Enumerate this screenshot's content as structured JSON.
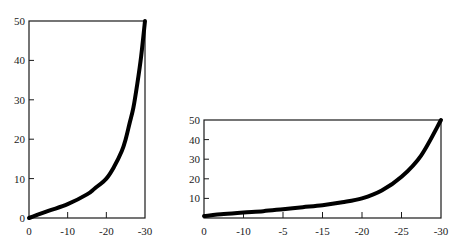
{
  "chart_data": [
    {
      "type": "line",
      "title": "",
      "xlabel": "",
      "ylabel": "",
      "grid": false,
      "legend": null,
      "xlim": [
        0,
        -30
      ],
      "ylim": [
        0,
        50
      ],
      "x_ticks": [
        "0",
        "-10",
        "-20",
        "-30"
      ],
      "y_ticks": [
        "0",
        "10",
        "20",
        "30",
        "40",
        "50"
      ],
      "series": [
        {
          "name": "curve",
          "x": [
            0,
            -5,
            -10,
            -15,
            -17,
            -20,
            -22,
            -24,
            -25,
            -26,
            -27,
            -28,
            -29,
            -30
          ],
          "y": [
            0,
            1.8,
            3.5,
            6,
            7.5,
            10,
            13,
            17,
            20,
            24,
            28,
            34,
            41,
            50
          ]
        }
      ],
      "frame": {
        "left": 29,
        "right": 145,
        "top": 21,
        "bottom": 218
      },
      "color": "#000000"
    },
    {
      "type": "line",
      "title": "",
      "xlabel": "",
      "ylabel": "",
      "grid": false,
      "legend": null,
      "ylim": [
        0,
        50
      ],
      "x_ticks": [
        "0",
        "-10",
        "-5",
        "-15",
        "-20",
        "-25",
        "-30"
      ],
      "y_ticks": [
        "10",
        "20",
        "30",
        "40",
        "50"
      ],
      "series": [
        {
          "name": "curve",
          "x_positions": [
            0,
            0.5,
            1,
            1.5,
            2,
            2.5,
            3,
            3.5,
            4,
            4.5,
            5,
            5.5,
            6
          ],
          "y": [
            1,
            2,
            2.8,
            3.5,
            4.5,
            5.5,
            6.5,
            8,
            10,
            14,
            21,
            32,
            50
          ]
        }
      ],
      "frame": {
        "left": 204,
        "right": 441,
        "top": 120,
        "bottom": 218
      },
      "color": "#000000"
    }
  ]
}
